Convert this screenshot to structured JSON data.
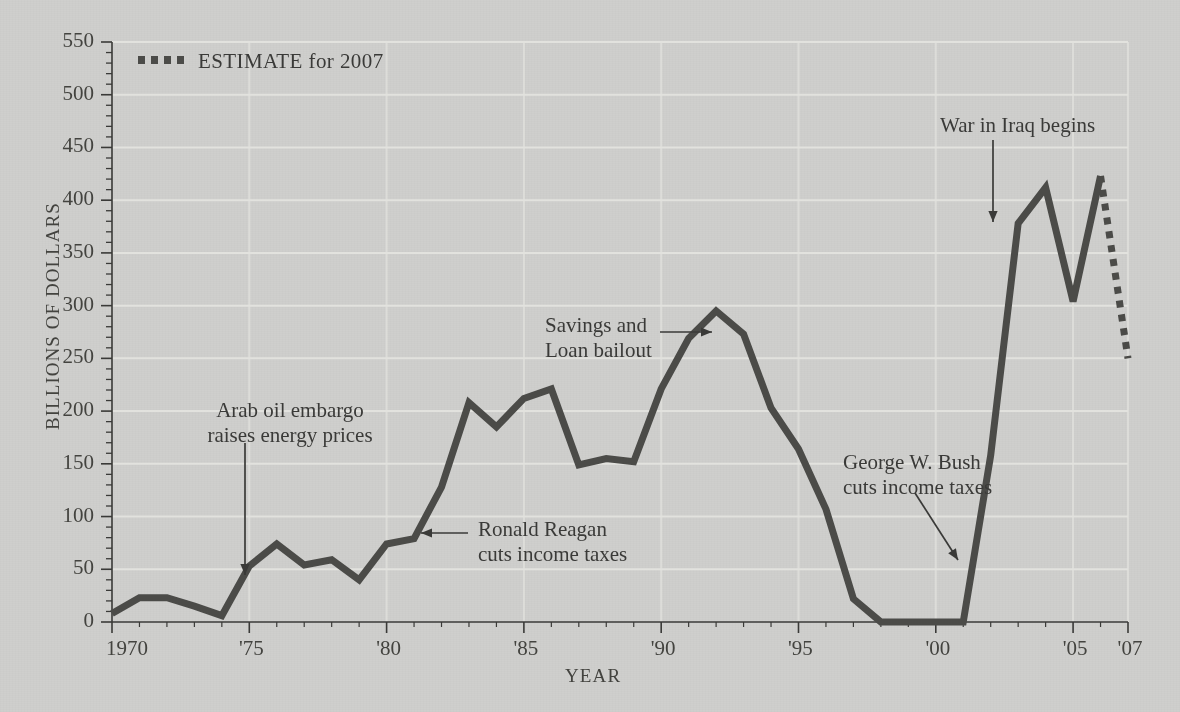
{
  "chart_data": {
    "type": "line",
    "title": "",
    "xlabel": "YEAR",
    "ylabel": "BILLIONS OF DOLLARS",
    "xlim": [
      1970,
      2007
    ],
    "ylim": [
      0,
      550
    ],
    "y_ticks": [
      0,
      50,
      100,
      150,
      200,
      250,
      300,
      350,
      400,
      450,
      500,
      550
    ],
    "y_tick_labels": [
      "0",
      "50",
      "100",
      "150",
      "200",
      "250",
      "300",
      "350",
      "400",
      "450",
      "500",
      "550"
    ],
    "y_minor_tick_step": 10,
    "x_ticks": [
      1970,
      1975,
      1980,
      1985,
      1990,
      1995,
      2000,
      2005,
      2007
    ],
    "x_tick_labels": [
      "1970",
      "'75",
      "'80",
      "'85",
      "'90",
      "'95",
      "'00",
      "'05",
      "'07"
    ],
    "grid": "horizontal-and-vertical-light",
    "legend_position": "top-left",
    "series": [
      {
        "name": "Deficit",
        "style": "solid",
        "color": "#4b4b48",
        "x": [
          1970,
          1971,
          1972,
          1973,
          1974,
          1975,
          1976,
          1977,
          1978,
          1979,
          1980,
          1981,
          1982,
          1983,
          1984,
          1985,
          1986,
          1987,
          1988,
          1989,
          1990,
          1991,
          1992,
          1993,
          1994,
          1995,
          1996,
          1997,
          1998,
          1999,
          2000,
          2001,
          2002,
          2003,
          2004,
          2005,
          2006
        ],
        "values": [
          8,
          23,
          23,
          15,
          6,
          53,
          74,
          54,
          59,
          40,
          74,
          79,
          128,
          208,
          185,
          212,
          221,
          149,
          155,
          152,
          221,
          269,
          295,
          273,
          203,
          164,
          107,
          22,
          0,
          0,
          0,
          0,
          158,
          378,
          412,
          304,
          423
        ]
      },
      {
        "name": "ESTIMATE for 2007",
        "style": "dotted",
        "color": "#4b4b48",
        "x": [
          2006,
          2007
        ],
        "values": [
          423,
          250
        ]
      }
    ],
    "legend": [
      {
        "label": "ESTIMATE for 2007",
        "style": "dotted",
        "color": "#4b4b48"
      }
    ],
    "annotations": [
      {
        "id": "arab-oil-embargo",
        "text_lines": [
          "Arab oil embargo",
          "raises energy prices"
        ],
        "arrow": "down",
        "points_to_year": 1974,
        "points_to_value": 60
      },
      {
        "id": "ronald-reagan",
        "text_lines": [
          "Ronald Reagan",
          "cuts income taxes"
        ],
        "arrow": "left",
        "points_to_year": 1981,
        "points_to_value": 79
      },
      {
        "id": "savings-and-loan",
        "text_lines": [
          "Savings and",
          "Loan bailout"
        ],
        "arrow": "right",
        "points_to_year": 1991,
        "points_to_value": 269
      },
      {
        "id": "george-w-bush",
        "text_lines": [
          "George W. Bush",
          "cuts income taxes"
        ],
        "arrow": "down-right",
        "points_to_year": 2001,
        "points_to_value": 85
      },
      {
        "id": "war-in-iraq",
        "text_lines": [
          "War in Iraq begins"
        ],
        "arrow": "down",
        "points_to_year": 2003,
        "points_to_value": 395
      }
    ]
  },
  "colors": {
    "background": "#cfcfcd",
    "line": "#4b4b48",
    "axis": "#3a3a38",
    "grid": "#e2e2de",
    "text": "#3a3a38"
  }
}
